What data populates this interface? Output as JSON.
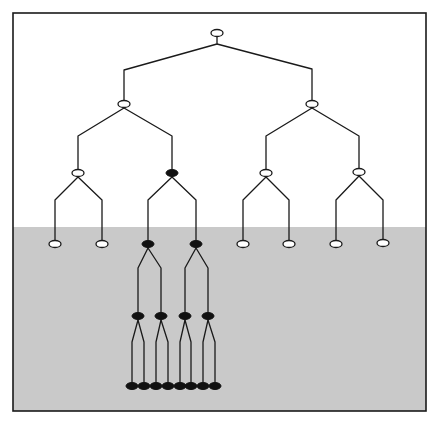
{
  "diagram": {
    "type": "binary-tree",
    "frame": {
      "x": 13,
      "y": 13,
      "width": 413,
      "height": 398,
      "border_color": "#1a1a1a"
    },
    "background": {
      "upper_color": "#ffffff",
      "lower_color": "#c9c9c9",
      "band_start_y": 227
    },
    "node_size": {
      "rx": 6,
      "ry": 3.5
    },
    "nodes": [
      {
        "id": "root",
        "x": 217,
        "y": 33,
        "filled": false
      },
      {
        "id": "L1a",
        "x": 124,
        "y": 104,
        "filled": false
      },
      {
        "id": "L1b",
        "x": 312,
        "y": 104,
        "filled": false
      },
      {
        "id": "L2a",
        "x": 78,
        "y": 173,
        "filled": false
      },
      {
        "id": "L2b",
        "x": 172,
        "y": 173,
        "filled": true
      },
      {
        "id": "L2c",
        "x": 266,
        "y": 173,
        "filled": false
      },
      {
        "id": "L2d",
        "x": 359,
        "y": 172,
        "filled": false
      },
      {
        "id": "L3a",
        "x": 55,
        "y": 244,
        "filled": false
      },
      {
        "id": "L3b",
        "x": 102,
        "y": 244,
        "filled": false
      },
      {
        "id": "L3c",
        "x": 148,
        "y": 244,
        "filled": true
      },
      {
        "id": "L3d",
        "x": 196,
        "y": 244,
        "filled": true
      },
      {
        "id": "L3e",
        "x": 243,
        "y": 244,
        "filled": false
      },
      {
        "id": "L3f",
        "x": 289,
        "y": 244,
        "filled": false
      },
      {
        "id": "L3g",
        "x": 336,
        "y": 244,
        "filled": false
      },
      {
        "id": "L3h",
        "x": 383,
        "y": 243,
        "filled": false
      },
      {
        "id": "L4a",
        "x": 138,
        "y": 316,
        "filled": true
      },
      {
        "id": "L4b",
        "x": 161,
        "y": 316,
        "filled": true
      },
      {
        "id": "L4c",
        "x": 185,
        "y": 316,
        "filled": true
      },
      {
        "id": "L4d",
        "x": 208,
        "y": 316,
        "filled": true
      },
      {
        "id": "L5a",
        "x": 132,
        "y": 386,
        "filled": true
      },
      {
        "id": "L5b",
        "x": 144,
        "y": 386,
        "filled": true
      },
      {
        "id": "L5c",
        "x": 156,
        "y": 386,
        "filled": true
      },
      {
        "id": "L5d",
        "x": 168,
        "y": 386,
        "filled": true
      },
      {
        "id": "L5e",
        "x": 180,
        "y": 386,
        "filled": true
      },
      {
        "id": "L5f",
        "x": 191,
        "y": 386,
        "filled": true
      },
      {
        "id": "L5g",
        "x": 203,
        "y": 386,
        "filled": true
      },
      {
        "id": "L5h",
        "x": 215,
        "y": 386,
        "filled": true
      }
    ],
    "edges": [
      {
        "points": [
          [
            217,
            37
          ],
          [
            217,
            44
          ],
          [
            124,
            70
          ],
          [
            124,
            100
          ]
        ]
      },
      {
        "points": [
          [
            217,
            44
          ],
          [
            312,
            69
          ],
          [
            312,
            100
          ]
        ]
      },
      {
        "points": [
          [
            124,
            108
          ],
          [
            78,
            136
          ],
          [
            78,
            169
          ]
        ]
      },
      {
        "points": [
          [
            124,
            108
          ],
          [
            172,
            136
          ],
          [
            172,
            169
          ]
        ]
      },
      {
        "points": [
          [
            312,
            108
          ],
          [
            266,
            136
          ],
          [
            266,
            169
          ]
        ]
      },
      {
        "points": [
          [
            312,
            108
          ],
          [
            359,
            136
          ],
          [
            359,
            168
          ]
        ]
      },
      {
        "points": [
          [
            78,
            177
          ],
          [
            55,
            200
          ],
          [
            55,
            240
          ]
        ]
      },
      {
        "points": [
          [
            78,
            177
          ],
          [
            102,
            200
          ],
          [
            102,
            240
          ]
        ]
      },
      {
        "points": [
          [
            172,
            177
          ],
          [
            148,
            200
          ],
          [
            148,
            240
          ]
        ]
      },
      {
        "points": [
          [
            172,
            177
          ],
          [
            196,
            200
          ],
          [
            196,
            240
          ]
        ]
      },
      {
        "points": [
          [
            266,
            177
          ],
          [
            243,
            200
          ],
          [
            243,
            240
          ]
        ]
      },
      {
        "points": [
          [
            266,
            177
          ],
          [
            289,
            200
          ],
          [
            289,
            240
          ]
        ]
      },
      {
        "points": [
          [
            359,
            176
          ],
          [
            336,
            200
          ],
          [
            336,
            240
          ]
        ]
      },
      {
        "points": [
          [
            359,
            176
          ],
          [
            383,
            200
          ],
          [
            383,
            239
          ]
        ]
      },
      {
        "points": [
          [
            148,
            248
          ],
          [
            138,
            268
          ],
          [
            138,
            312
          ]
        ]
      },
      {
        "points": [
          [
            148,
            248
          ],
          [
            161,
            268
          ],
          [
            161,
            312
          ]
        ]
      },
      {
        "points": [
          [
            196,
            248
          ],
          [
            185,
            268
          ],
          [
            185,
            312
          ]
        ]
      },
      {
        "points": [
          [
            196,
            248
          ],
          [
            208,
            268
          ],
          [
            208,
            312
          ]
        ]
      },
      {
        "points": [
          [
            138,
            320
          ],
          [
            132,
            342
          ],
          [
            132,
            382
          ]
        ]
      },
      {
        "points": [
          [
            138,
            320
          ],
          [
            144,
            342
          ],
          [
            144,
            382
          ]
        ]
      },
      {
        "points": [
          [
            161,
            320
          ],
          [
            156,
            342
          ],
          [
            156,
            382
          ]
        ]
      },
      {
        "points": [
          [
            161,
            320
          ],
          [
            168,
            342
          ],
          [
            168,
            382
          ]
        ]
      },
      {
        "points": [
          [
            185,
            320
          ],
          [
            180,
            342
          ],
          [
            180,
            382
          ]
        ]
      },
      {
        "points": [
          [
            185,
            320
          ],
          [
            191,
            342
          ],
          [
            191,
            382
          ]
        ]
      },
      {
        "points": [
          [
            208,
            320
          ],
          [
            203,
            342
          ],
          [
            203,
            382
          ]
        ]
      },
      {
        "points": [
          [
            208,
            320
          ],
          [
            215,
            342
          ],
          [
            215,
            382
          ]
        ]
      }
    ]
  }
}
